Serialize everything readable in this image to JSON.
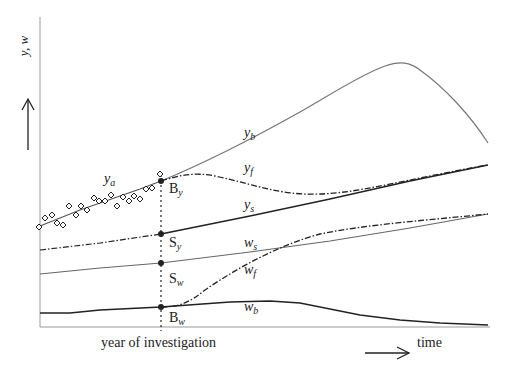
{
  "axes": {
    "y_label": "y, w",
    "x_label": "time",
    "investigation_label": "year of investigation"
  },
  "curve_labels": {
    "y_a": {
      "base": "y",
      "sub": "a"
    },
    "y_b": {
      "base": "y",
      "sub": "b"
    },
    "y_f": {
      "base": "y",
      "sub": "f"
    },
    "y_s": {
      "base": "y",
      "sub": "s"
    },
    "w_s": {
      "base": "w",
      "sub": "s"
    },
    "w_f": {
      "base": "w",
      "sub": "f"
    },
    "w_b": {
      "base": "w",
      "sub": "b"
    }
  },
  "point_labels": {
    "B_y": {
      "base": "B",
      "sub": "y"
    },
    "S_y": {
      "base": "S",
      "sub": "y"
    },
    "S_w": {
      "base": "S",
      "sub": "w"
    },
    "B_w": {
      "base": "B",
      "sub": "w"
    }
  },
  "colors": {
    "ink": "#222222",
    "grey_line": "#777777",
    "axis": "#999999"
  }
}
